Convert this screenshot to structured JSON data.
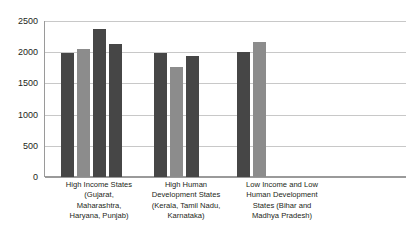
{
  "chart_data": {
    "type": "bar",
    "title": "",
    "subtitle": "",
    "xlabel": "",
    "ylabel": "",
    "ylim": [
      0,
      2500
    ],
    "ytick_values": [
      2500,
      2000,
      1500,
      1000,
      500,
      0
    ],
    "ytick_labels": [
      "2500",
      "2000",
      "1500",
      "1000",
      "500",
      "0"
    ],
    "grid": true,
    "legend": "none",
    "legend_entries": [],
    "categories": [
      "High Income States (Gujarat, Maharashtra, Haryana, Punjab)",
      "High Human Development States (Kerala, Tamil Nadu, Karnataka)",
      "Low Income and Low Human Development States (Bihar and Madhya Pradesh)"
    ],
    "category_label_lines": [
      [
        "High Income States",
        "(Gujarat,",
        "Maharashtra,",
        "Haryana, Punjab)"
      ],
      [
        "High Human",
        "Development States",
        "(Kerala, Tamil Nadu,",
        "Karnataka)"
      ],
      [
        "Low Income and Low",
        "Human Development",
        "States (Bihar and",
        "Madhya Pradesh)"
      ]
    ],
    "groups": [
      {
        "category": "High Income States (Gujarat, Maharashtra, Haryana, Punjab)",
        "bars": [
          {
            "value": 1990,
            "color": "#464646"
          },
          {
            "value": 2050,
            "color": "#8c8c8c"
          },
          {
            "value": 2380,
            "color": "#464646"
          },
          {
            "value": 2130,
            "color": "#464646"
          }
        ]
      },
      {
        "category": "High Human Development States (Kerala, Tamil Nadu, Karnataka)",
        "bars": [
          {
            "value": 1995,
            "color": "#464646"
          },
          {
            "value": 1770,
            "color": "#8c8c8c"
          },
          {
            "value": 1940,
            "color": "#464646"
          }
        ]
      },
      {
        "category": "Low Income and Low Human Development States (Bihar and Madhya Pradesh)",
        "bars": [
          {
            "value": 2010,
            "color": "#464646"
          },
          {
            "value": 2160,
            "color": "#8c8c8c"
          }
        ]
      }
    ],
    "colors": {
      "bar_dark": "#464646",
      "bar_light": "#8c8c8c",
      "gridline": "#c8c8c8",
      "axis": "#9a9a9a",
      "text": "#231f20",
      "background": "#ffffff"
    }
  }
}
